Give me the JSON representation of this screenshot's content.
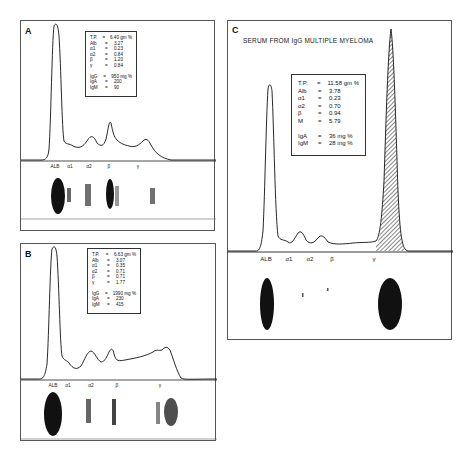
{
  "figure": {
    "panels": [
      {
        "id": "A",
        "letter": "A",
        "values": [
          {
            "key": "T.P.",
            "eq": "=",
            "val": "6.40 gm %"
          },
          {
            "key": "Alb",
            "eq": "=",
            "val": "3.27"
          },
          {
            "key": "α1",
            "eq": "=",
            "val": "0.23"
          },
          {
            "key": "α2",
            "eq": "=",
            "val": "0.84"
          },
          {
            "key": "β",
            "eq": "=",
            "val": "1.20"
          },
          {
            "key": "γ",
            "eq": "=",
            "val": "0.84"
          }
        ],
        "immunoglobulins": [
          {
            "key": "IgG",
            "eq": "=",
            "val": "950 mg %"
          },
          {
            "key": "IgA",
            "eq": "=",
            "val": "200"
          },
          {
            "key": "IgM",
            "eq": "=",
            "val": "90"
          }
        ],
        "axis_labels": [
          "ALB",
          "α1",
          "α2",
          "β",
          "γ"
        ]
      },
      {
        "id": "B",
        "letter": "B",
        "values": [
          {
            "key": "T.P.",
            "eq": "=",
            "val": "6.63 gm %"
          },
          {
            "key": "Alb",
            "eq": "=",
            "val": "3.07"
          },
          {
            "key": "α1",
            "eq": "=",
            "val": "0.35"
          },
          {
            "key": "α2",
            "eq": "=",
            "val": "0.71"
          },
          {
            "key": "β",
            "eq": "=",
            "val": "0.71"
          },
          {
            "key": "γ",
            "eq": "=",
            "val": "1.77"
          }
        ],
        "immunoglobulins": [
          {
            "key": "IgG",
            "eq": "=",
            "val": "1990 mg %"
          },
          {
            "key": "IgA",
            "eq": "=",
            "val": "230"
          },
          {
            "key": "IgM",
            "eq": "=",
            "val": "415"
          }
        ],
        "axis_labels": [
          "ALB",
          "α1",
          "α2",
          "β",
          "γ"
        ]
      },
      {
        "id": "C",
        "letter": "C",
        "subtitle": "SERUM FROM IgG MULTIPLE MYELOMA",
        "values": [
          {
            "key": "T.P.",
            "eq": "=",
            "val": "11.58 gm %"
          },
          {
            "key": "Alb",
            "eq": "=",
            "val": "3.78"
          },
          {
            "key": "α1",
            "eq": "=",
            "val": "0.23"
          },
          {
            "key": "α2",
            "eq": "=",
            "val": "0.70"
          },
          {
            "key": "β",
            "eq": "=",
            "val": "0.94"
          },
          {
            "key": "M",
            "eq": "=",
            "val": "5.79"
          }
        ],
        "immunoglobulins": [
          {
            "key": "IgA",
            "eq": "=",
            "val": "36 mg %"
          },
          {
            "key": "IgM",
            "eq": "=",
            "val": "28 mg %"
          }
        ],
        "axis_labels": [
          "ALB",
          "α1",
          "α2",
          "β",
          "γ"
        ]
      }
    ],
    "colors": {
      "ink": "#111111",
      "frame": "#555555",
      "paper": "#ffffff"
    }
  }
}
